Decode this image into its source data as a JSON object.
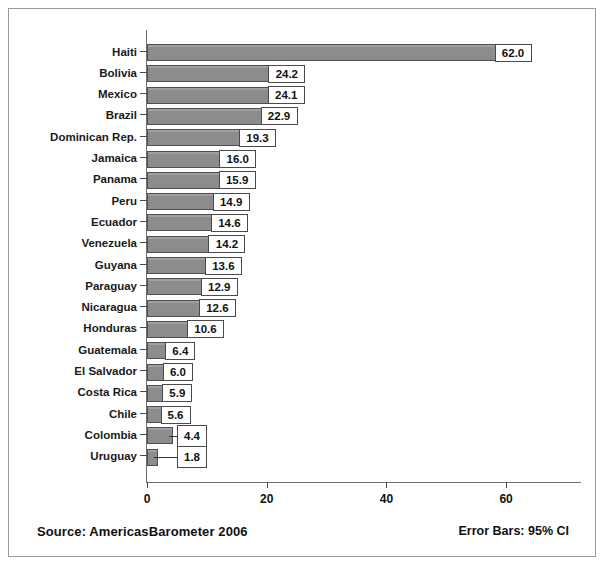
{
  "figure": {
    "source_note": "Source: AmericasBarometer  2006",
    "error_note": "Error Bars: 95% CI",
    "bar_color": "#8c8c8c",
    "bar_border_color": "#4f4f4f",
    "axis_color": "#6f6f6f",
    "label_box_bg": "#ffffff"
  },
  "chart_data": {
    "type": "bar",
    "orientation": "horizontal",
    "title": "",
    "subtitle": "",
    "xlabel": "",
    "ylabel": "",
    "xlim": [
      0,
      72.8
    ],
    "xticks": [
      0,
      20,
      40,
      60
    ],
    "xticklabels": [
      "0",
      "20",
      "40",
      "60"
    ],
    "grid": false,
    "legend": "none",
    "annotations": [
      "Source: AmericasBarometer  2006",
      "Error Bars: 95% CI"
    ],
    "categories": [
      "Haiti",
      "Bolivia",
      "Mexico",
      "Brazil",
      "Dominican Rep.",
      "Jamaica",
      "Panama",
      "Peru",
      "Ecuador",
      "Venezuela",
      "Guyana",
      "Paraguay",
      "Nicaragua",
      "Honduras",
      "Guatemala",
      "El Salvador",
      "Costa Rica",
      "Chile",
      "Colombia",
      "Uruguay"
    ],
    "values": [
      62.0,
      24.2,
      24.1,
      22.9,
      19.3,
      16.0,
      15.9,
      14.9,
      14.6,
      14.2,
      13.6,
      12.9,
      12.6,
      10.6,
      6.4,
      6.0,
      5.9,
      5.6,
      4.4,
      1.8
    ],
    "value_labels": [
      "62.0",
      "24.2",
      "24.1",
      "22.9",
      "19.3",
      "16.0",
      "15.9",
      "14.9",
      "14.6",
      "14.2",
      "13.6",
      "12.9",
      "12.6",
      "10.6",
      "6.4",
      "6.0",
      "5.9",
      "5.6",
      "4.4",
      "1.8"
    ],
    "label_offset_right": [
      false,
      false,
      false,
      false,
      false,
      false,
      false,
      false,
      false,
      false,
      false,
      false,
      false,
      false,
      false,
      false,
      false,
      false,
      true,
      true
    ]
  }
}
